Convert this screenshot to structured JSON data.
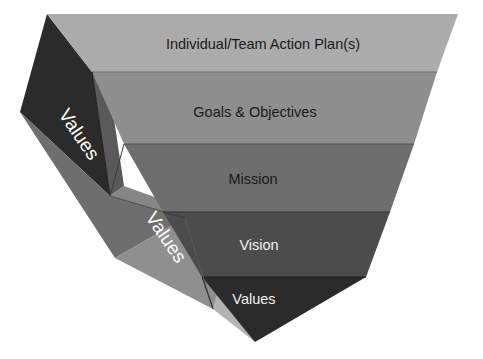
{
  "diagram": {
    "type": "inverted-pyramid",
    "background_color": "#ffffff",
    "layers": [
      {
        "id": "action-plans",
        "label": "Individual/Team Action Plan(s)",
        "level": 1,
        "face_color": "#ababab",
        "text_color": "#1a1a1a"
      },
      {
        "id": "goals-objectives",
        "label": "Goals & Objectives",
        "level": 2,
        "face_color": "#8e8e8e",
        "text_color": "#1a1a1a"
      },
      {
        "id": "mission",
        "label": "Mission",
        "level": 3,
        "face_color": "#6e6e6e",
        "text_color": "#1a1a1a"
      },
      {
        "id": "vision",
        "label": "Vision",
        "level": 4,
        "face_color": "#4c4c4c",
        "text_color": "#f2f2f2"
      },
      {
        "id": "values-core",
        "label": "Values",
        "level": 5,
        "face_color": "#2b2b2b",
        "text_color": "#f2f2f2"
      }
    ],
    "side_faces": [
      {
        "id": "values-outer-side",
        "label": "Values",
        "face_color": "#2b2b2b",
        "text_color": "#ffffff",
        "rotation_deg": 54
      },
      {
        "id": "values-inner-side",
        "label": "Values",
        "face_color": "#6e6e6e",
        "text_color": "#ffffff",
        "rotation_deg": 54
      }
    ],
    "side_shading": {
      "upper_band_color": "#545454",
      "mid_band_color": "#7d7d7d",
      "lower_band_color": "#9a9a9a",
      "edge_line_color": "#3a3a3a"
    }
  }
}
